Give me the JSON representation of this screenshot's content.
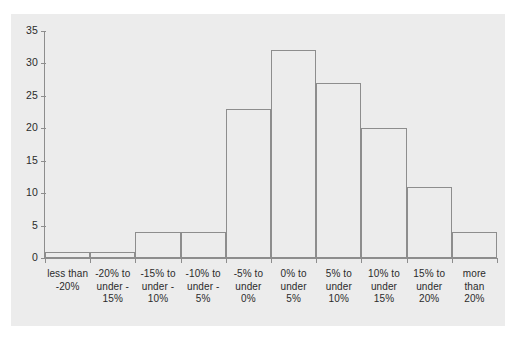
{
  "chart_data": {
    "type": "bar",
    "title": "",
    "subtitle": "",
    "xlabel": "",
    "ylabel": "",
    "categories": [
      "less than\n-20%",
      "-20% to\nunder -\n15%",
      "-15% to\nunder -\n10%",
      "-10% to\nunder -\n5%",
      "-5% to\nunder\n0%",
      "0% to\nunder\n5%",
      "5% to\nunder\n10%",
      "10% to\nunder\n15%",
      "15% to\nunder\n20%",
      "more\nthan\n20%"
    ],
    "values": [
      1,
      1,
      4,
      4,
      23,
      32,
      27,
      20,
      11,
      4
    ],
    "ylim": [
      0,
      35
    ],
    "yticks": [
      0,
      5,
      10,
      15,
      20,
      25,
      30,
      35
    ],
    "ytick_labels": [
      "0",
      "5",
      "10",
      "15",
      "20",
      "25",
      "30",
      "35"
    ],
    "grid": false,
    "legend": null,
    "bar_style": {
      "fill": "none",
      "edge_color": "#8d8d8d"
    },
    "panel_color": "#ececec",
    "axis_color": "#8d8d8d",
    "text_color": "#2b2b2b"
  },
  "top_fragment": ""
}
